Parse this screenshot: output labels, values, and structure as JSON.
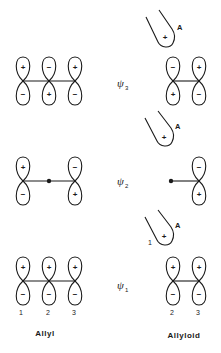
{
  "diagram": {
    "type": "molecular-orbital-comparison",
    "columns": {
      "left": {
        "label": "Allyl"
      },
      "right": {
        "label": "Allyloid"
      }
    },
    "hybrid_label": "A",
    "atom_numbers": {
      "allyl": [
        "1",
        "2",
        "3"
      ],
      "allyloid_hybrid": "1",
      "allyloid": [
        "2",
        "3"
      ]
    },
    "levels": [
      {
        "name": "psi3",
        "psi_symbol": "ψ",
        "subscript": "3",
        "allyl_lobes": [
          {
            "top": "+",
            "bottom": "−"
          },
          {
            "top": "−",
            "bottom": "+"
          },
          {
            "top": "+",
            "bottom": "−"
          }
        ],
        "hybrid_sign": "+",
        "allyloid_lobes": [
          {
            "top": "−",
            "bottom": "+"
          },
          {
            "top": "+",
            "bottom": "−"
          }
        ]
      },
      {
        "name": "psi2",
        "psi_symbol": "ψ",
        "subscript": "2",
        "allyl_lobes": [
          {
            "top": "+",
            "bottom": "−"
          },
          {
            "node": true
          },
          {
            "top": "−",
            "bottom": "+"
          }
        ],
        "hybrid_sign": "+",
        "allyloid_lobes": [
          {
            "node": true
          },
          {
            "top": "−",
            "bottom": "+"
          }
        ]
      },
      {
        "name": "psi1",
        "psi_symbol": "ψ",
        "subscript": "1",
        "allyl_lobes": [
          {
            "top": "+",
            "bottom": "−"
          },
          {
            "top": "+",
            "bottom": "−"
          },
          {
            "top": "+",
            "bottom": "−"
          }
        ],
        "hybrid_sign": "+",
        "allyloid_lobes": [
          {
            "top": "+",
            "bottom": "−"
          },
          {
            "top": "+",
            "bottom": "−"
          }
        ]
      }
    ]
  }
}
